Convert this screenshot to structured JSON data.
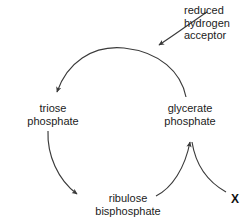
{
  "diagram": {
    "background_color": "#ffffff",
    "stroke_color": "#3a3a3a",
    "text_color": "#1c1c1c",
    "nodes": [
      {
        "id": "reduced-hydrogen-acceptor",
        "line1": "reduced",
        "line2": "hydrogen",
        "line3": "acceptor"
      },
      {
        "id": "triose-phosphate",
        "line1": "triose",
        "line2": "phosphate"
      },
      {
        "id": "glycerate-phosphate",
        "line1": "glycerate",
        "line2": "phosphate"
      },
      {
        "id": "ribulose-bisphosphate",
        "line1": "ribulose",
        "line2": "bisphosphate"
      }
    ],
    "annotations": {
      "unknown_marker": "X"
    }
  }
}
